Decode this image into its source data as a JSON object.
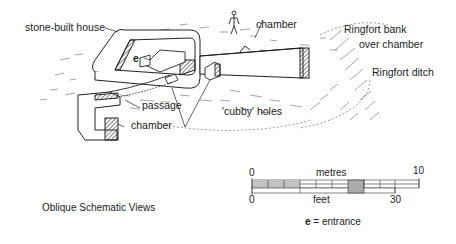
{
  "figure": {
    "labels": {
      "house": "stone-built house",
      "chamber_top": "chamber",
      "ringfort_bank_1": "Ringfort bank",
      "ringfort_bank_2": "over chamber",
      "ringfort_ditch": "Ringfort ditch",
      "entrance_marker": "e",
      "passage": "passage",
      "chamber_bottom": "chamber",
      "cubby_holes": "'cubby' holes"
    },
    "caption": "Oblique Schematic Views"
  },
  "scale_bar": {
    "metres_label": "metres",
    "metres_start": "0",
    "metres_end": "10",
    "feet_label": "feet",
    "feet_start": "0",
    "feet_end": "30"
  },
  "legend": {
    "key": "e",
    "text": "= entrance"
  }
}
